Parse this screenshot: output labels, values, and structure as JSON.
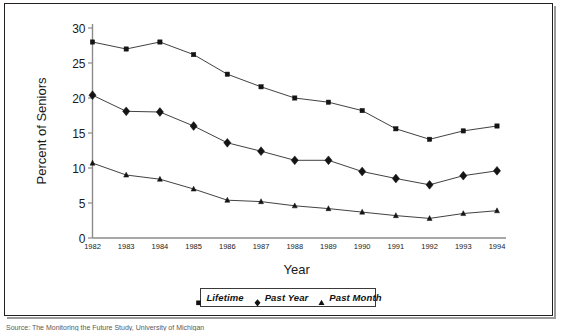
{
  "figure": {
    "frame_border_color": "#231f20",
    "background_color": "#ffffff",
    "caption_partial": "Source: The Monitoring the Future Study, University of Michigan"
  },
  "legend": {
    "position": "bottom-center",
    "entries": [
      {
        "label": "Lifetime",
        "marker": "square"
      },
      {
        "label": "Past Year",
        "marker": "diamond"
      },
      {
        "label": "Past Month",
        "marker": "triangle"
      }
    ]
  },
  "chart_data": {
    "type": "line",
    "title": "",
    "xlabel": "Year",
    "ylabel": "Percent of Seniors",
    "x": [
      1982,
      1983,
      1984,
      1985,
      1986,
      1987,
      1988,
      1989,
      1990,
      1991,
      1992,
      1993,
      1994
    ],
    "categories": [
      "1982",
      "1983",
      "1984",
      "1985",
      "1986",
      "1987",
      "1988",
      "1989",
      "1990",
      "1991",
      "1992",
      "1993",
      "1994"
    ],
    "series": [
      {
        "name": "Lifetime",
        "marker": "square",
        "values": [
          28.0,
          27.0,
          28.0,
          26.2,
          23.4,
          21.6,
          20.0,
          19.4,
          18.2,
          15.6,
          14.1,
          15.3,
          16.0
        ]
      },
      {
        "name": "Past Year",
        "marker": "diamond",
        "values": [
          20.4,
          18.1,
          18.0,
          16.0,
          13.6,
          12.4,
          11.1,
          11.1,
          9.5,
          8.5,
          7.6,
          8.9,
          9.6
        ]
      },
      {
        "name": "Past Month",
        "marker": "triangle",
        "values": [
          10.7,
          9.0,
          8.4,
          7.0,
          5.4,
          5.2,
          4.6,
          4.2,
          3.7,
          3.2,
          2.8,
          3.5,
          3.9
        ]
      }
    ],
    "ylim": [
      0,
      30
    ],
    "yticks": [
      0,
      5,
      10,
      15,
      20,
      25,
      30
    ],
    "ytick_labels": [
      "0",
      "5",
      "10",
      "15",
      "20",
      "25",
      "30"
    ],
    "grid": false,
    "legend_position": "bottom-center"
  }
}
